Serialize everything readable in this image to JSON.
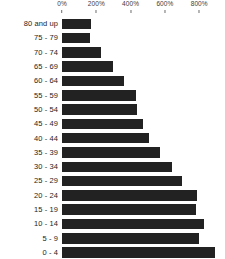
{
  "chart_data": {
    "type": "bar",
    "orientation": "horizontal",
    "title": "",
    "subtitle": "",
    "xlabel": "",
    "ylabel": "",
    "grid": false,
    "legend": null,
    "legend_position": "none",
    "bar_color": "#222222",
    "axis_position": "top",
    "xlim": [
      0,
      900
    ],
    "xtick_labels": [
      "0%",
      "200%",
      "400%",
      "600%",
      "800%"
    ],
    "xtick_values": [
      0,
      200,
      400,
      600,
      800
    ],
    "categories": [
      "80 and up",
      "75 - 79",
      "70 - 74",
      "65 - 69",
      "60 - 64",
      "55 - 59",
      "50 - 54",
      "45 - 49",
      "40 - 44",
      "35 - 39",
      "30 - 34",
      "25 - 29",
      "20 - 24",
      "15 - 19",
      "10 - 14",
      "5 - 9",
      "0 - 4"
    ],
    "values": [
      170,
      165,
      230,
      300,
      360,
      430,
      440,
      470,
      510,
      570,
      640,
      700,
      790,
      780,
      830,
      800,
      890
    ]
  }
}
